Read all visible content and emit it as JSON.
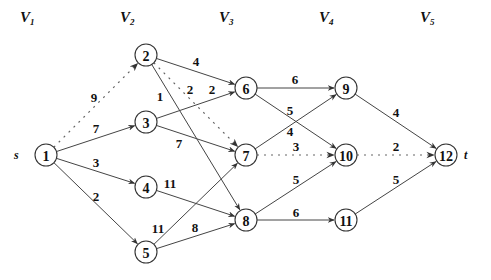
{
  "stages": [
    {
      "main": "V",
      "sub": "1",
      "x": 20
    },
    {
      "main": "V",
      "sub": "2",
      "x": 120
    },
    {
      "main": "V",
      "sub": "3",
      "x": 219
    },
    {
      "main": "V",
      "sub": "4",
      "x": 319
    },
    {
      "main": "V",
      "sub": "5",
      "x": 420
    }
  ],
  "source_label": "s",
  "sink_label": "t",
  "nodes": [
    {
      "id": "1",
      "x": 46,
      "y": 155
    },
    {
      "id": "2",
      "x": 146,
      "y": 55
    },
    {
      "id": "3",
      "x": 146,
      "y": 122
    },
    {
      "id": "4",
      "x": 146,
      "y": 187
    },
    {
      "id": "5",
      "x": 146,
      "y": 252
    },
    {
      "id": "6",
      "x": 246,
      "y": 88
    },
    {
      "id": "7",
      "x": 246,
      "y": 155
    },
    {
      "id": "8",
      "x": 246,
      "y": 220
    },
    {
      "id": "9",
      "x": 346,
      "y": 88
    },
    {
      "id": "10",
      "x": 346,
      "y": 155
    },
    {
      "id": "11",
      "x": 346,
      "y": 220
    },
    {
      "id": "12",
      "x": 446,
      "y": 155
    }
  ],
  "edges": [
    {
      "from": "1",
      "to": "2",
      "weight": "9",
      "style": "dotted",
      "lx": 94,
      "ly": 97
    },
    {
      "from": "1",
      "to": "3",
      "weight": "7",
      "style": "solid",
      "lx": 96,
      "ly": 128
    },
    {
      "from": "1",
      "to": "4",
      "weight": "3",
      "style": "solid",
      "lx": 96,
      "ly": 162
    },
    {
      "from": "1",
      "to": "5",
      "weight": "2",
      "style": "solid",
      "lx": 96,
      "ly": 196
    },
    {
      "from": "2",
      "to": "6",
      "weight": "4",
      "style": "solid",
      "lx": 196,
      "ly": 61
    },
    {
      "from": "2",
      "to": "7",
      "weight": "2",
      "style": "dotted",
      "lx": 190,
      "ly": 89
    },
    {
      "from": "2",
      "to": "8",
      "weight": "1",
      "style": "solid",
      "lx": 160,
      "ly": 96
    },
    {
      "from": "3",
      "to": "6",
      "weight": "2",
      "style": "solid",
      "lx": 212,
      "ly": 89
    },
    {
      "from": "3",
      "to": "7",
      "weight": "7",
      "style": "solid",
      "lx": 179,
      "ly": 143
    },
    {
      "from": "4",
      "to": "8",
      "weight": "11",
      "style": "solid",
      "lx": 170,
      "ly": 183
    },
    {
      "from": "5",
      "to": "7",
      "weight": "11",
      "style": "solid",
      "lx": 158,
      "ly": 228
    },
    {
      "from": "5",
      "to": "8",
      "weight": "8",
      "style": "solid",
      "lx": 195,
      "ly": 227
    },
    {
      "from": "6",
      "to": "9",
      "weight": "6",
      "style": "solid",
      "lx": 295,
      "ly": 79
    },
    {
      "from": "6",
      "to": "10",
      "weight": "5",
      "style": "solid",
      "lx": 290,
      "ly": 110
    },
    {
      "from": "7",
      "to": "9",
      "weight": "4",
      "style": "solid",
      "lx": 290,
      "ly": 131
    },
    {
      "from": "7",
      "to": "10",
      "weight": "3",
      "style": "dotted",
      "lx": 296,
      "ly": 146
    },
    {
      "from": "8",
      "to": "10",
      "weight": "5",
      "style": "solid",
      "lx": 296,
      "ly": 179
    },
    {
      "from": "8",
      "to": "11",
      "weight": "6",
      "style": "solid",
      "lx": 296,
      "ly": 212
    },
    {
      "from": "9",
      "to": "12",
      "weight": "4",
      "style": "solid",
      "lx": 396,
      "ly": 112
    },
    {
      "from": "10",
      "to": "12",
      "weight": "2",
      "style": "dotted",
      "lx": 396,
      "ly": 146
    },
    {
      "from": "11",
      "to": "12",
      "weight": "5",
      "style": "solid",
      "lx": 396,
      "ly": 179
    }
  ],
  "node_radius": 11
}
